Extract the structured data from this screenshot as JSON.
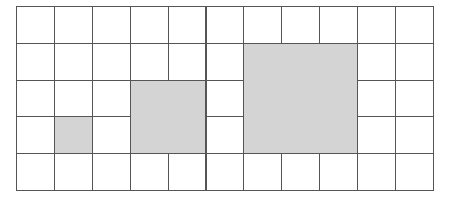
{
  "grid": {
    "columns": 11,
    "rows": 5,
    "cell_width": 37.9,
    "cell_height": 36.8,
    "line_color": "#555555",
    "background": "#ffffff"
  },
  "shaded_squares": [
    {
      "name": "square-1x1",
      "col": 1,
      "row": 3,
      "size": 1,
      "color": "#d4d4d4"
    },
    {
      "name": "square-2x2",
      "col": 3,
      "row": 2,
      "size": 2,
      "color": "#d4d4d4"
    },
    {
      "name": "square-3x3",
      "col": 6,
      "row": 1,
      "size": 3,
      "color": "#d4d4d4"
    }
  ]
}
